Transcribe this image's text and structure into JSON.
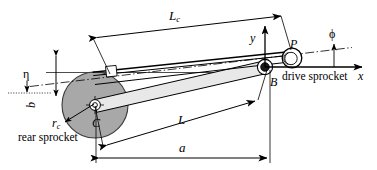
{
  "figure": {
    "type": "engineering-kinematic-diagram",
    "background_color": "#ffffff",
    "line_color": "#000000",
    "sprocket_fill": "#a8a8a8",
    "tube_fill": "#e2e2e2"
  },
  "labels": {
    "chain_length": "L",
    "chain_length_sub": "c",
    "swingarm_length": "L",
    "horizontal_distance": "a",
    "vertical_offset": "b",
    "eta_angle": "η",
    "phi_angle": "ϕ",
    "sprocket_radius": "r",
    "sprocket_radius_sub": "c",
    "point_c": "C",
    "point_b": "B",
    "point_p": "P",
    "axis_x": "x",
    "axis_y": "y",
    "rear_sprocket": "rear sprocket",
    "drive_sprocket": "drive sprocket"
  },
  "geometry": {
    "rear_sprocket_center": [
      95,
      105
    ],
    "rear_sprocket_radius": 33,
    "pivot_b": [
      265,
      67
    ],
    "point_p": [
      292,
      58
    ],
    "drive_sprocket_radius": 10,
    "origin": [
      265,
      67
    ],
    "x_axis_end": [
      368,
      67
    ],
    "y_axis_end": [
      265,
      22
    ],
    "dimension_a": {
      "from": [
        96,
        158
      ],
      "to": [
        270,
        158
      ]
    },
    "dimension_b": {
      "from": [
        56,
        52
      ],
      "to": [
        56,
        100
      ]
    },
    "dimension_L": {
      "from": [
        103,
        146
      ],
      "to": [
        258,
        100
      ]
    },
    "dimension_Lc": {
      "from": [
        93,
        38
      ],
      "to": [
        281,
        16
      ]
    }
  }
}
